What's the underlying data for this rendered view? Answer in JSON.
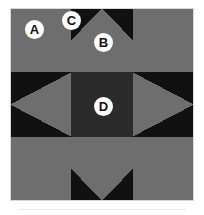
{
  "colors": {
    "background": "#ffffff",
    "medium_gray": "#6e6e6e",
    "black": "#111111",
    "center_charcoal": "#2b2b2b",
    "callout_fill": "#fdfdfd",
    "callout_text": "#101010",
    "caption_rule": "#e9e9e9"
  },
  "block": {
    "grid": "3x3",
    "width_px": 184,
    "height_px": 193,
    "cell_width_px": 61.33,
    "cell_height_px": 64.33,
    "units": [
      {
        "position": "top-left",
        "type": "corner-square",
        "color": "medium_gray"
      },
      {
        "position": "top-center",
        "type": "flying-geese",
        "background": "black",
        "triangle": "medium_gray",
        "points": "up"
      },
      {
        "position": "top-right",
        "type": "corner-square",
        "color": "medium_gray"
      },
      {
        "position": "middle-left",
        "type": "flying-geese",
        "background": "black",
        "triangle": "medium_gray",
        "points": "left"
      },
      {
        "position": "center",
        "type": "center-square",
        "color": "center_charcoal"
      },
      {
        "position": "middle-right",
        "type": "flying-geese",
        "background": "black",
        "triangle": "medium_gray",
        "points": "right"
      },
      {
        "position": "bottom-left",
        "type": "corner-square",
        "color": "medium_gray"
      },
      {
        "position": "bottom-center",
        "type": "flying-geese",
        "background": "black",
        "triangle": "medium_gray",
        "points": "down"
      },
      {
        "position": "bottom-right",
        "type": "corner-square",
        "color": "medium_gray"
      }
    ]
  },
  "callouts": [
    {
      "id": "a",
      "label": "A",
      "refers_to": "corner square, medium gray"
    },
    {
      "id": "c",
      "label": "C",
      "refers_to": "background corner triangle, black"
    },
    {
      "id": "b",
      "label": "B",
      "refers_to": "flying-geese triangle, medium gray"
    },
    {
      "id": "d",
      "label": "D",
      "refers_to": "center square, dark charcoal"
    }
  ]
}
